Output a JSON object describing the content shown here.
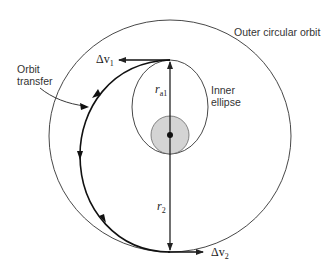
{
  "diagram": {
    "type": "hohmann-transfer-orbit",
    "labels": {
      "outer_orbit": "Outer circular orbit",
      "inner_ellipse_line1": "Inner",
      "inner_ellipse_line2": "ellipse",
      "orbit_transfer_line1": "Orbit",
      "orbit_transfer_line2": "transfer",
      "delta_v1_symbol": "Δv",
      "delta_v1_sub": "1",
      "delta_v2_symbol": "Δv",
      "delta_v2_sub": "2",
      "r_a1_symbol": "r",
      "r_a1_sub": "a1",
      "r_2_symbol": "r",
      "r_2_sub": "2"
    },
    "colors": {
      "line": "#222222",
      "planet_fill": "#d4d4d4",
      "background": "#ffffff"
    }
  }
}
